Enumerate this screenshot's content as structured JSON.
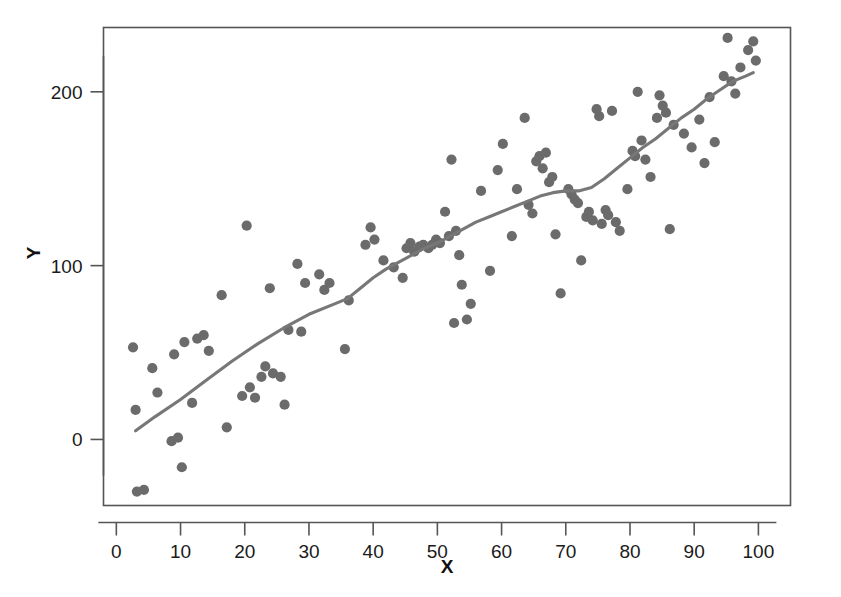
{
  "chart_data": {
    "type": "scatter",
    "title": "",
    "subtitle": "",
    "xlabel": "X",
    "ylabel": "Y",
    "xlim": [
      -2,
      105
    ],
    "ylim": [
      -38,
      237
    ],
    "xticks": [
      0,
      10,
      20,
      30,
      40,
      50,
      60,
      70,
      80,
      90,
      100
    ],
    "xtick_labels": [
      "0",
      "10",
      "20",
      "30",
      "40",
      "50",
      "60",
      "70",
      "80",
      "90",
      "100"
    ],
    "yticks": [
      0,
      100,
      200
    ],
    "ytick_labels": [
      "0",
      "100",
      "200"
    ],
    "grid": false,
    "legend": null,
    "legend_position": "none",
    "marker_color": "#6b6b6b",
    "line_color": "#777777",
    "frame_color": "#555555",
    "background_color": "#ffffff",
    "n_points": 120,
    "series": [
      {
        "name": "observations",
        "type": "scatter",
        "points": [
          [
            2.6,
            53
          ],
          [
            3.0,
            17
          ],
          [
            3.2,
            -30
          ],
          [
            4.3,
            -29
          ],
          [
            5.6,
            41
          ],
          [
            6.4,
            27
          ],
          [
            8.6,
            -1
          ],
          [
            9.0,
            49
          ],
          [
            9.6,
            1
          ],
          [
            10.2,
            -16
          ],
          [
            10.6,
            56
          ],
          [
            11.8,
            21
          ],
          [
            12.6,
            58
          ],
          [
            13.6,
            60
          ],
          [
            14.4,
            51
          ],
          [
            16.4,
            83
          ],
          [
            17.2,
            7
          ],
          [
            19.6,
            25
          ],
          [
            20.3,
            123
          ],
          [
            20.8,
            30
          ],
          [
            21.6,
            24
          ],
          [
            22.6,
            36
          ],
          [
            23.2,
            42
          ],
          [
            23.9,
            87
          ],
          [
            24.4,
            38
          ],
          [
            25.6,
            36
          ],
          [
            26.2,
            20
          ],
          [
            26.8,
            63
          ],
          [
            28.2,
            101
          ],
          [
            28.8,
            62
          ],
          [
            29.4,
            90
          ],
          [
            31.6,
            95
          ],
          [
            32.4,
            86
          ],
          [
            33.2,
            90
          ],
          [
            35.6,
            52
          ],
          [
            36.2,
            80
          ],
          [
            38.8,
            112
          ],
          [
            39.6,
            122
          ],
          [
            40.2,
            115
          ],
          [
            41.6,
            103
          ],
          [
            43.2,
            99
          ],
          [
            44.6,
            93
          ],
          [
            45.2,
            110
          ],
          [
            45.8,
            113
          ],
          [
            46.4,
            108
          ],
          [
            47.2,
            111
          ],
          [
            47.8,
            112
          ],
          [
            48.6,
            110
          ],
          [
            49.2,
            112
          ],
          [
            49.8,
            115
          ],
          [
            50.4,
            113
          ],
          [
            51.2,
            131
          ],
          [
            51.8,
            117
          ],
          [
            52.2,
            161
          ],
          [
            52.6,
            67
          ],
          [
            52.9,
            120
          ],
          [
            53.4,
            106
          ],
          [
            53.8,
            89
          ],
          [
            54.6,
            69
          ],
          [
            55.2,
            78
          ],
          [
            56.8,
            143
          ],
          [
            58.2,
            97
          ],
          [
            59.4,
            155
          ],
          [
            60.2,
            170
          ],
          [
            61.6,
            117
          ],
          [
            62.4,
            144
          ],
          [
            63.6,
            185
          ],
          [
            64.2,
            135
          ],
          [
            64.8,
            130
          ],
          [
            65.4,
            160
          ],
          [
            65.9,
            163
          ],
          [
            66.4,
            156
          ],
          [
            66.9,
            165
          ],
          [
            67.4,
            148
          ],
          [
            67.9,
            151
          ],
          [
            68.4,
            118
          ],
          [
            69.2,
            84
          ],
          [
            70.4,
            144
          ],
          [
            70.9,
            141
          ],
          [
            71.4,
            138
          ],
          [
            71.9,
            136
          ],
          [
            72.4,
            103
          ],
          [
            73.2,
            128
          ],
          [
            73.6,
            131
          ],
          [
            74.2,
            126
          ],
          [
            74.8,
            190
          ],
          [
            75.2,
            186
          ],
          [
            75.6,
            124
          ],
          [
            76.2,
            132
          ],
          [
            76.6,
            129
          ],
          [
            77.2,
            189
          ],
          [
            77.8,
            125
          ],
          [
            78.4,
            120
          ],
          [
            79.6,
            144
          ],
          [
            80.4,
            166
          ],
          [
            80.8,
            163
          ],
          [
            81.2,
            200
          ],
          [
            81.8,
            172
          ],
          [
            82.4,
            161
          ],
          [
            83.2,
            151
          ],
          [
            84.2,
            185
          ],
          [
            84.6,
            198
          ],
          [
            85.1,
            192
          ],
          [
            85.6,
            188
          ],
          [
            86.2,
            121
          ],
          [
            86.8,
            181
          ],
          [
            88.4,
            176
          ],
          [
            89.6,
            168
          ],
          [
            90.8,
            184
          ],
          [
            91.6,
            159
          ],
          [
            92.4,
            197
          ],
          [
            93.2,
            171
          ],
          [
            94.6,
            209
          ],
          [
            95.2,
            231
          ],
          [
            95.8,
            206
          ],
          [
            96.4,
            199
          ],
          [
            97.2,
            214
          ],
          [
            98.4,
            224
          ],
          [
            99.2,
            229
          ],
          [
            99.6,
            218
          ]
        ]
      },
      {
        "name": "smoother",
        "type": "line",
        "points": [
          [
            3.0,
            5
          ],
          [
            6.0,
            13
          ],
          [
            10.0,
            23
          ],
          [
            14.0,
            34
          ],
          [
            18.0,
            45
          ],
          [
            22.0,
            55
          ],
          [
            26.0,
            64
          ],
          [
            30.0,
            72
          ],
          [
            34.0,
            78
          ],
          [
            36.0,
            81
          ],
          [
            38.0,
            87
          ],
          [
            40.0,
            93
          ],
          [
            42.0,
            98
          ],
          [
            44.0,
            102
          ],
          [
            46.0,
            106
          ],
          [
            48.0,
            110
          ],
          [
            50.0,
            113
          ],
          [
            52.0,
            117
          ],
          [
            54.0,
            121
          ],
          [
            56.0,
            125
          ],
          [
            58.0,
            128
          ],
          [
            60.0,
            131
          ],
          [
            62.0,
            134
          ],
          [
            64.0,
            137
          ],
          [
            66.0,
            140
          ],
          [
            68.0,
            142
          ],
          [
            70.0,
            143
          ],
          [
            72.0,
            143
          ],
          [
            74.0,
            145
          ],
          [
            76.0,
            150
          ],
          [
            78.0,
            156
          ],
          [
            80.0,
            162
          ],
          [
            82.0,
            168
          ],
          [
            84.0,
            173
          ],
          [
            86.0,
            179
          ],
          [
            88.0,
            185
          ],
          [
            90.0,
            190
          ],
          [
            92.0,
            196
          ],
          [
            94.0,
            201
          ],
          [
            96.0,
            206
          ],
          [
            98.0,
            209
          ],
          [
            99.2,
            211
          ]
        ]
      }
    ]
  },
  "axes": {
    "x_title": "X",
    "y_title": "Y"
  },
  "artifact": {
    "bleed_text": ""
  }
}
